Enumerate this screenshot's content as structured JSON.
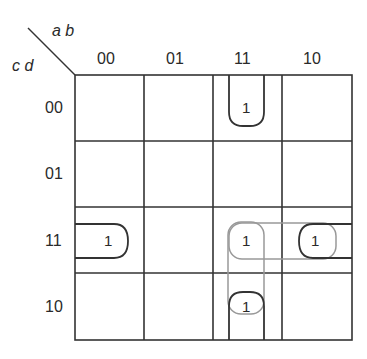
{
  "kmap": {
    "row_var_label": "c d",
    "col_var_label": "a b",
    "col_headers": [
      "00",
      "01",
      "11",
      "10"
    ],
    "row_headers": [
      "00",
      "01",
      "11",
      "10"
    ],
    "cells": [
      [
        "",
        "",
        "1",
        ""
      ],
      [
        "",
        "",
        "",
        ""
      ],
      [
        "1",
        "",
        "1",
        "1"
      ],
      [
        "",
        "",
        "1",
        ""
      ]
    ],
    "groupings": [
      {
        "name": "column-11-wrap",
        "cells": [
          "00-11",
          "10-11"
        ],
        "style": "dark"
      },
      {
        "name": "row-11-wrap",
        "cells": [
          "11-00",
          "11-10"
        ],
        "style": "dark"
      },
      {
        "name": "row11-col11-col10",
        "cells": [
          "11-11",
          "11-10"
        ],
        "style": "light"
      },
      {
        "name": "col11-row11-row10",
        "cells": [
          "11-11",
          "10-11"
        ],
        "style": "light"
      }
    ]
  }
}
